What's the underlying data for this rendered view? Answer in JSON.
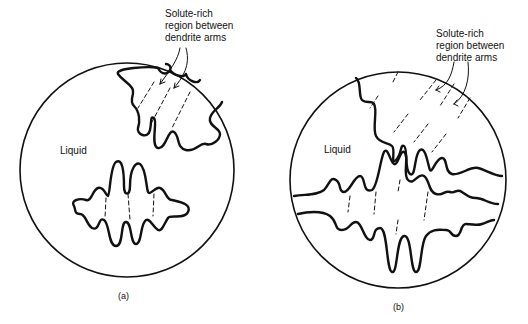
{
  "panels": [
    {
      "id": "a",
      "caption": "(a)",
      "liquid_label": "Liquid",
      "annotation": [
        "Solute-rich",
        "region between",
        "dendrite arms"
      ]
    },
    {
      "id": "b",
      "caption": "(b)",
      "liquid_label": "Liquid",
      "annotation": [
        "Solute-rich",
        "region between",
        "dendrite arms"
      ]
    }
  ],
  "colors": {
    "ink": "#111111",
    "background": "#ffffff"
  }
}
